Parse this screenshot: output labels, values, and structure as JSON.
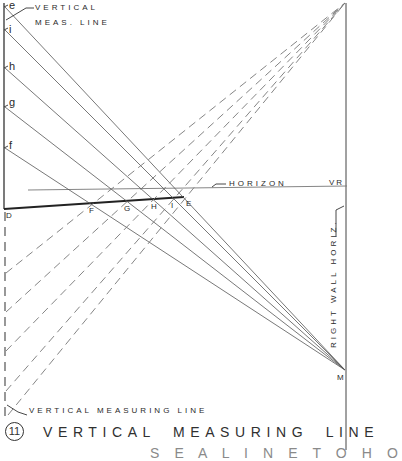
{
  "diagram": {
    "title_number": "11",
    "title": "VERTICAL MEASURING LINE",
    "subtitle_partial": "S E  A  L I N E  T O  H O",
    "labels": {
      "vertical_meas_line_top_1": "VERTICAL",
      "vertical_meas_line_top_2": "MEAS. LINE",
      "vertical_measuring_line_bottom": "VERTICAL MEASURING LINE",
      "horizon": "HORIZON",
      "vr": "VR",
      "right_wall_horiz": "RIGHT WALL HORIZ.",
      "m": "M",
      "d": "D"
    },
    "measure_points_left": [
      {
        "label": "e",
        "y": 7
      },
      {
        "label": "i",
        "y": 30
      },
      {
        "label": "h",
        "y": 68
      },
      {
        "label": "g",
        "y": 107
      },
      {
        "label": "f",
        "y": 148
      }
    ],
    "ground_points": [
      {
        "label": "F",
        "x": 91,
        "y": 203
      },
      {
        "label": "G",
        "x": 125,
        "y": 201
      },
      {
        "label": "H",
        "x": 152,
        "y": 199
      },
      {
        "label": "I",
        "x": 172,
        "y": 198
      },
      {
        "label": "E",
        "x": 184,
        "y": 197
      }
    ],
    "colors": {
      "line": "#3a3a3a",
      "thin_line": "#555555",
      "dashed_line": "#7a7a7a",
      "background": "#ffffff"
    }
  }
}
